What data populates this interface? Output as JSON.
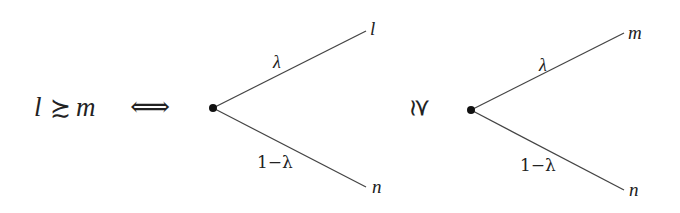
{
  "relation": {
    "lhs": "l",
    "symbol": "≿",
    "rhs": "m",
    "equivalence": "⟺"
  },
  "left_tree": {
    "top_outcome": "l",
    "bottom_outcome": "n",
    "top_prob": "λ",
    "bottom_prob": "1−λ"
  },
  "middle_symbol": "≿",
  "right_tree": {
    "top_outcome": "m",
    "bottom_outcome": "n",
    "top_prob": "λ",
    "bottom_prob": "1−λ"
  },
  "colors": {
    "line": "#444444",
    "node": "#111111",
    "text": "#222222"
  }
}
